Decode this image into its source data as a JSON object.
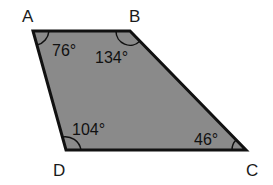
{
  "figure": {
    "type": "quadrilateral",
    "fill_color": "#8a8a8a",
    "stroke_color": "#111111",
    "vertices": [
      {
        "label": "A",
        "x": 33,
        "y": 31,
        "angle": "76°"
      },
      {
        "label": "B",
        "x": 130,
        "y": 31,
        "angle": "134°"
      },
      {
        "label": "C",
        "x": 246,
        "y": 150,
        "angle": "46°"
      },
      {
        "label": "D",
        "x": 66,
        "y": 150,
        "angle": "104°"
      }
    ]
  },
  "labels": {
    "A": "A",
    "B": "B",
    "C": "C",
    "D": "D"
  },
  "angles": {
    "A": "76°",
    "B": "134°",
    "C": "46°",
    "D": "104°"
  }
}
